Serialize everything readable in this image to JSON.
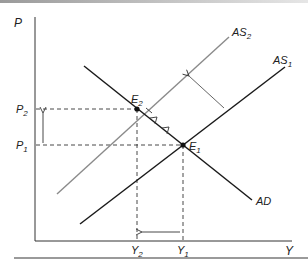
{
  "diagram": {
    "type": "AS-AD model",
    "axes": {
      "y_label": "P",
      "x_label": "Y"
    },
    "curves": [
      {
        "id": "AS2",
        "label_base": "AS",
        "label_sub": "2",
        "color": "#8a8a8a",
        "from": [
          57,
          194
        ],
        "to": [
          229,
          37
        ]
      },
      {
        "id": "AS1",
        "label_base": "AS",
        "label_sub": "1",
        "color": "#1a1a1a",
        "from": [
          80,
          224
        ],
        "to": [
          285,
          67
        ]
      },
      {
        "id": "AD",
        "label_base": "AD",
        "label_sub": "",
        "color": "#1a1a1a",
        "from": [
          84,
          66
        ],
        "to": [
          252,
          200
        ]
      }
    ],
    "equilibria": [
      {
        "id": "E2",
        "label_base": "E",
        "label_sub": "2",
        "x": 137,
        "y": 109
      },
      {
        "id": "E1",
        "label_base": "E",
        "label_sub": "1",
        "x": 183,
        "y": 145
      }
    ],
    "price_levels": [
      {
        "label_base": "P",
        "label_sub": "2"
      },
      {
        "label_base": "P",
        "label_sub": "1"
      }
    ],
    "output_levels": [
      {
        "label_base": "Y",
        "label_sub": "2"
      },
      {
        "label_base": "Y",
        "label_sub": "1"
      }
    ],
    "annotations": [
      "Supply shift arrow from AS1 toward AS2",
      "Price rises from P1 to P2",
      "Output falls from Y1 to Y2",
      "Movement along AD from E1 to E2"
    ]
  }
}
